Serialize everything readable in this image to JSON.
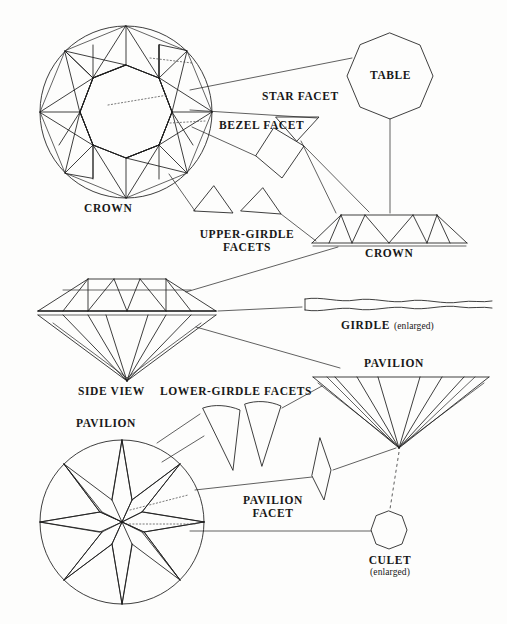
{
  "document": {
    "title": "Diamond Facet Nomenclature",
    "background_color": "#fdfdfc",
    "ink_color": "#1c1c1c"
  },
  "labels": {
    "crown_face_up": "CROWN",
    "star_facet": "STAR FACET",
    "bezel_facet": "BEZEL FACET",
    "table": "TABLE",
    "upper_girdle_facets_line1": "UPPER-GIRDLE",
    "upper_girdle_facets_line2": "FACETS",
    "crown_profile": "CROWN",
    "side_view": "SIDE VIEW",
    "girdle_main": "GIRDLE",
    "girdle_qualifier": "(enlarged)",
    "lower_girdle_facets": "LOWER-GIRDLE FACETS",
    "pavilion_profile": "PAVILION",
    "pavilion_face_down": "PAVILION",
    "pavilion_facet_line1": "PAVILION",
    "pavilion_facet_line2": "FACET",
    "culet_main": "CULET",
    "culet_qualifier": "(enlarged)"
  },
  "figures": [
    {
      "id": "crown-top-view",
      "name": "crown-top-view",
      "kind": "round-brilliant-crown-face-up",
      "center": [
        126,
        112
      ],
      "radius": 86,
      "facet_counts": {
        "table": 1,
        "star": 8,
        "bezel": 8,
        "upper_girdle": 16
      }
    },
    {
      "id": "table-octagon",
      "name": "table-octagon-enlarged",
      "kind": "octagon",
      "center": [
        390,
        76
      ],
      "radius": 43,
      "sides": 8
    },
    {
      "id": "star-facet-shape",
      "name": "star-facet-shape",
      "kind": "inverted-triangle",
      "center": [
        297,
        128
      ]
    },
    {
      "id": "bezel-facet-shape",
      "name": "bezel-facet-shape",
      "kind": "kite",
      "center": [
        277,
        152
      ]
    },
    {
      "id": "upper-girdle-facet-shape-left",
      "name": "upper-girdle-facet-shape-left",
      "kind": "triangle",
      "center": [
        212,
        200
      ]
    },
    {
      "id": "upper-girdle-facet-shape-right",
      "name": "upper-girdle-facet-shape-right",
      "kind": "triangle",
      "center": [
        261,
        203
      ]
    },
    {
      "id": "crown-profile",
      "name": "crown-profile-view",
      "kind": "trapezoid-with-facets",
      "center": [
        394,
        228
      ]
    },
    {
      "id": "diamond-side-view",
      "name": "diamond-side-view",
      "kind": "full-brilliant-profile",
      "center": [
        127,
        311
      ]
    },
    {
      "id": "girdle-enlarged",
      "name": "girdle-enlarged-strip",
      "kind": "wavy-band",
      "center": [
        400,
        304
      ]
    },
    {
      "id": "pavilion-profile",
      "name": "pavilion-profile-view",
      "kind": "inverted-cone",
      "center": [
        399,
        410
      ]
    },
    {
      "id": "lower-girdle-facet-shape-left",
      "name": "lower-girdle-facet-shape-left",
      "kind": "curved-wedge",
      "center": [
        223,
        425
      ]
    },
    {
      "id": "lower-girdle-facet-shape-right",
      "name": "lower-girdle-facet-shape-right",
      "kind": "curved-wedge",
      "center": [
        263,
        420
      ]
    },
    {
      "id": "pavilion-facet-shape",
      "name": "pavilion-facet-shape",
      "kind": "narrow-lozenge",
      "center": [
        322,
        470
      ]
    },
    {
      "id": "pavilion-bottom-view",
      "name": "pavilion-bottom-view",
      "kind": "round-brilliant-pavilion-face-down",
      "center": [
        122,
        522
      ],
      "radius": 82,
      "facet_counts": {
        "pavilion_main": 8,
        "lower_girdle": 16,
        "culet": 1
      }
    },
    {
      "id": "culet-enlarged",
      "name": "culet-octagon-enlarged",
      "kind": "octagon",
      "center": [
        389,
        530
      ],
      "radius": 19,
      "sides": 8
    }
  ],
  "leader_lines": [
    {
      "name": "table-leader",
      "from": "crown-top-view",
      "to": "table-octagon"
    },
    {
      "name": "star-facet-leader",
      "from": "crown-top-view",
      "to": "star-facet-shape"
    },
    {
      "name": "bezel-facet-leader",
      "from": "crown-top-view",
      "to": "bezel-facet-shape"
    },
    {
      "name": "upper-girdle-facets-leader",
      "from": "crown-top-view",
      "to": "upper-girdle-facet-shapes"
    },
    {
      "name": "star-facet-to-profile-leader",
      "from": "star-facet-shape",
      "to": "crown-profile"
    },
    {
      "name": "bezel-facet-to-profile-leader",
      "from": "bezel-facet-shape",
      "to": "crown-profile"
    },
    {
      "name": "upper-girdle-to-profile-leader",
      "from": "upper-girdle-facet-shapes",
      "to": "crown-profile"
    },
    {
      "name": "table-to-profile-leader",
      "from": "table-octagon",
      "to": "crown-profile"
    },
    {
      "name": "crown-profile-to-side-view-leader",
      "from": "crown-profile",
      "to": "diamond-side-view"
    },
    {
      "name": "girdle-leader",
      "from": "diamond-side-view",
      "to": "girdle-enlarged"
    },
    {
      "name": "pavilion-profile-leader",
      "from": "diamond-side-view",
      "to": "pavilion-profile"
    },
    {
      "name": "lower-girdle-facets-leader",
      "from": "lower-girdle-facet-shapes",
      "to": "pavilion-bottom-view"
    },
    {
      "name": "lower-girdle-to-pavilion-profile-leader",
      "from": "lower-girdle-facet-shapes",
      "to": "pavilion-profile"
    },
    {
      "name": "pavilion-facet-leader",
      "from": "pavilion-bottom-view",
      "to": "pavilion-facet-shape"
    },
    {
      "name": "pavilion-facet-to-profile-leader",
      "from": "pavilion-facet-shape",
      "to": "pavilion-profile"
    },
    {
      "name": "culet-leader",
      "from": "pavilion-bottom-view",
      "to": "culet-enlarged"
    },
    {
      "name": "culet-from-profile-leader",
      "from": "pavilion-profile",
      "to": "culet-enlarged"
    }
  ]
}
